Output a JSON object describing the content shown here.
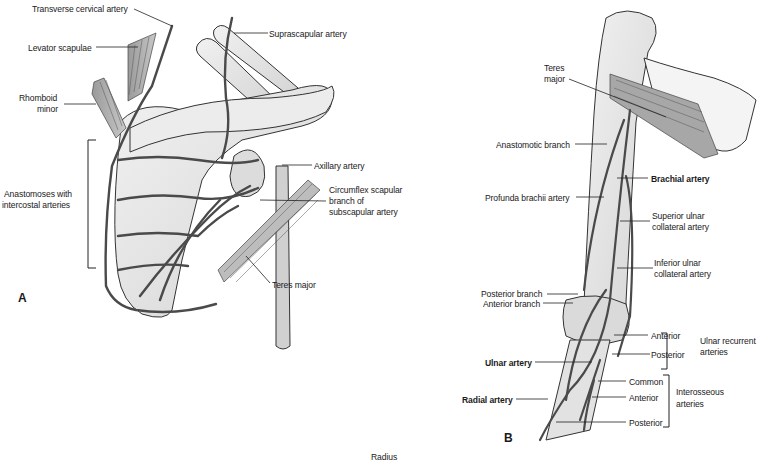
{
  "figure": {
    "panels": [
      {
        "id": "A",
        "letter": "A",
        "subject": "Scapular anastomosis (posterior view of scapula)",
        "labels": {
          "transverse_cervical": "Transverse cervical artery",
          "levator_scapulae": "Levator scapulae",
          "rhomboid_minor_1": "Rhomboid",
          "rhomboid_minor_2": "minor",
          "anastomoses_1": "Anastomoses with",
          "anastomoses_2": "intercostal arteries",
          "suprascapular": "Suprascapular artery",
          "axillary": "Axillary artery",
          "circumflex_1": "Circumflex scapular",
          "circumflex_2": "branch of",
          "circumflex_3": "subscapular artery",
          "teres_major": "Teres major"
        }
      },
      {
        "id": "B",
        "letter": "B",
        "subject": "Arterial anastomoses around the elbow",
        "labels": {
          "teres_major_1": "Teres",
          "teres_major_2": "major",
          "anastomotic_branch": "Anastomotic branch",
          "brachial_artery": "Brachial artery",
          "profunda_brachii": "Profunda brachii artery",
          "superior_ulnar_1": "Superior ulnar",
          "superior_ulnar_2": "collateral artery",
          "inferior_ulnar_1": "Inferior ulnar",
          "inferior_ulnar_2": "collateral artery",
          "posterior_branch": "Posterior branch",
          "anterior_branch": "Anterior branch",
          "ulnar_recurrent_anterior": "Anterior",
          "ulnar_recurrent_posterior": "Posterior",
          "ulnar_recurrent_group_1": "Ulnar recurrent",
          "ulnar_recurrent_group_2": "arteries",
          "ulnar_artery": "Ulnar artery",
          "radial_artery": "Radial artery",
          "interosseous_common": "Common",
          "interosseous_anterior": "Anterior",
          "interosseous_posterior": "Posterior",
          "interosseous_group_1": "Interosseous",
          "interosseous_group_2": "arteries"
        }
      }
    ],
    "footer_label": "Radius",
    "colors": {
      "background": "#ffffff",
      "ink": "#1a1a1a",
      "bone_fill": "#e6e6e6",
      "artery": "#555555",
      "muscle": "#8a8a8a"
    }
  }
}
